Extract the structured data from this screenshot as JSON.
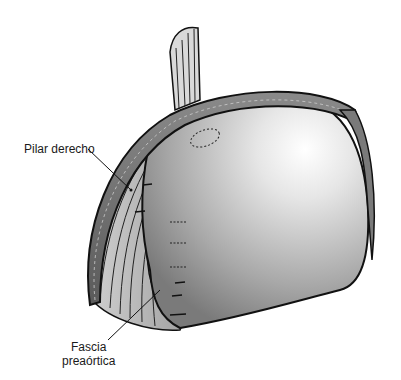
{
  "figure": {
    "labels": {
      "pilar_derecho": "Pilar derecho",
      "fascia_line1": "Fascia",
      "fascia_line2": "preaórtica"
    },
    "colors": {
      "background": "#ffffff",
      "outline": "#111111",
      "organ_light": "#f2f2f2",
      "organ_dark": "#8a8a8a",
      "band": "#5a5a5a"
    }
  }
}
